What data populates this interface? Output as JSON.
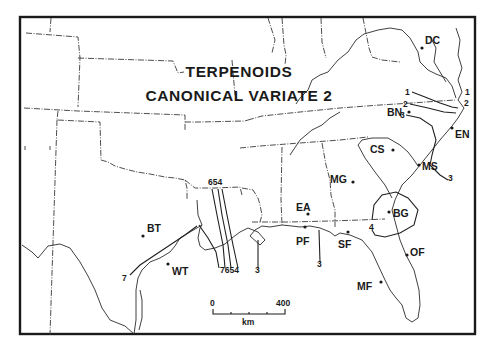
{
  "figure": {
    "title_line1": "TERPENOIDS",
    "title_line2": "CANONICAL VARIATE 2",
    "frame": {
      "x": 20,
      "y": 17,
      "width": 455,
      "height": 317
    }
  },
  "sites": [
    {
      "code": "DC",
      "dot": [
        422,
        48
      ],
      "label": [
        425,
        44
      ]
    },
    {
      "code": "BN",
      "dot": [
        409,
        112
      ],
      "label": [
        387,
        116
      ]
    },
    {
      "code": "EN",
      "dot": [
        452,
        128
      ],
      "label": [
        455,
        138
      ]
    },
    {
      "code": "CS",
      "dot": [
        393,
        150
      ],
      "label": [
        370,
        153
      ]
    },
    {
      "code": "MS",
      "dot": [
        419,
        165
      ],
      "label": [
        422,
        170
      ]
    },
    {
      "code": "MG",
      "dot": [
        353,
        182
      ],
      "label": [
        330,
        183
      ]
    },
    {
      "code": "EA",
      "dot": [
        308,
        214
      ],
      "label": [
        296,
        211
      ]
    },
    {
      "code": "BG",
      "dot": [
        389,
        212
      ],
      "label": [
        393,
        217
      ]
    },
    {
      "code": "PF",
      "dot": [
        305,
        227
      ],
      "label": [
        296,
        245
      ]
    },
    {
      "code": "SF",
      "dot": [
        348,
        232
      ],
      "label": [
        338,
        248
      ]
    },
    {
      "code": "OF",
      "dot": [
        407,
        255
      ],
      "label": [
        410,
        256
      ]
    },
    {
      "code": "MF",
      "dot": [
        381,
        282
      ],
      "label": [
        357,
        290
      ]
    },
    {
      "code": "BT",
      "dot": [
        143,
        236
      ],
      "label": [
        147,
        232
      ]
    },
    {
      "code": "WT",
      "dot": [
        168,
        264
      ],
      "label": [
        172,
        275
      ]
    }
  ],
  "isoline_labels": [
    {
      "text": "1",
      "pos": [
        405,
        95
      ]
    },
    {
      "text": "2",
      "pos": [
        403,
        107
      ]
    },
    {
      "text": "3",
      "pos": [
        400,
        118
      ]
    },
    {
      "text": "1",
      "pos": [
        465,
        95
      ]
    },
    {
      "text": "2",
      "pos": [
        464,
        106
      ]
    },
    {
      "text": "3",
      "pos": [
        448,
        181
      ]
    },
    {
      "text": "654",
      "pos": [
        208,
        185
      ]
    },
    {
      "text": "7654",
      "pos": [
        220,
        273
      ]
    },
    {
      "text": "3",
      "pos": [
        255,
        273
      ]
    },
    {
      "text": "3",
      "pos": [
        317,
        267
      ]
    },
    {
      "text": "4",
      "pos": [
        369,
        230
      ]
    },
    {
      "text": "7",
      "pos": [
        122,
        281
      ]
    }
  ],
  "scale_bar": {
    "min_label": "0",
    "max_label": "400",
    "unit": "km",
    "x0": 213,
    "x1": 285,
    "y": 313
  }
}
